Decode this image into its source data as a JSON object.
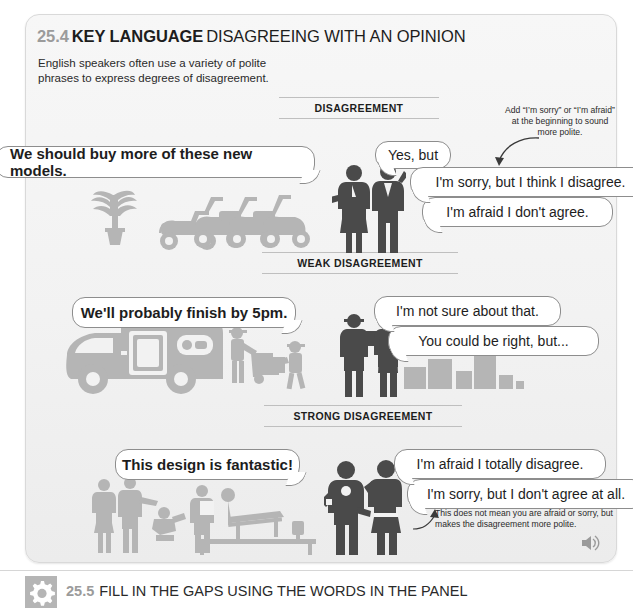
{
  "header": {
    "number": "25.4",
    "key_language": "KEY LANGUAGE",
    "title": "DISAGREEING WITH AN OPINION",
    "intro": "English speakers often use a variety of polite phrases to express degrees of disagreement."
  },
  "sections": [
    {
      "caption": "DISAGREEMENT",
      "statement": "We should buy more of these new models.",
      "responses": [
        "Yes, but",
        "I'm sorry, but I think I disagree.",
        "I'm afraid I don't agree."
      ],
      "note": "Add “I’m sorry” or “I’m afraid” at the beginning to sound more polite."
    },
    {
      "caption": "WEAK DISAGREEMENT",
      "statement": "We'll probably finish by 5pm.",
      "responses": [
        "I'm not sure about that.",
        "You could be right, but..."
      ],
      "note": ""
    },
    {
      "caption": "STRONG DISAGREEMENT",
      "statement": "This design is fantastic!",
      "responses": [
        "I'm afraid I totally disagree.",
        "I'm sorry, but I don't agree at all."
      ],
      "note": "This does not mean you are afraid or sorry, but makes the disagreement more polite."
    }
  ],
  "audio": {
    "icon": "speaker-icon"
  },
  "bottom": {
    "icon": "gear-icon",
    "number": "25.5",
    "title": "FILL IN THE GAPS USING THE WORDS IN THE PANEL"
  },
  "colors": {
    "panel_bg": "#f3f3f3",
    "panel_border": "#d9d9d9",
    "bubble_border": "#8d8d8d",
    "number_grey": "#9b9b9b",
    "text_dark": "#1d1d1d",
    "figure_dark": "#4a4a4a",
    "figure_light": "#b5b5b5"
  }
}
